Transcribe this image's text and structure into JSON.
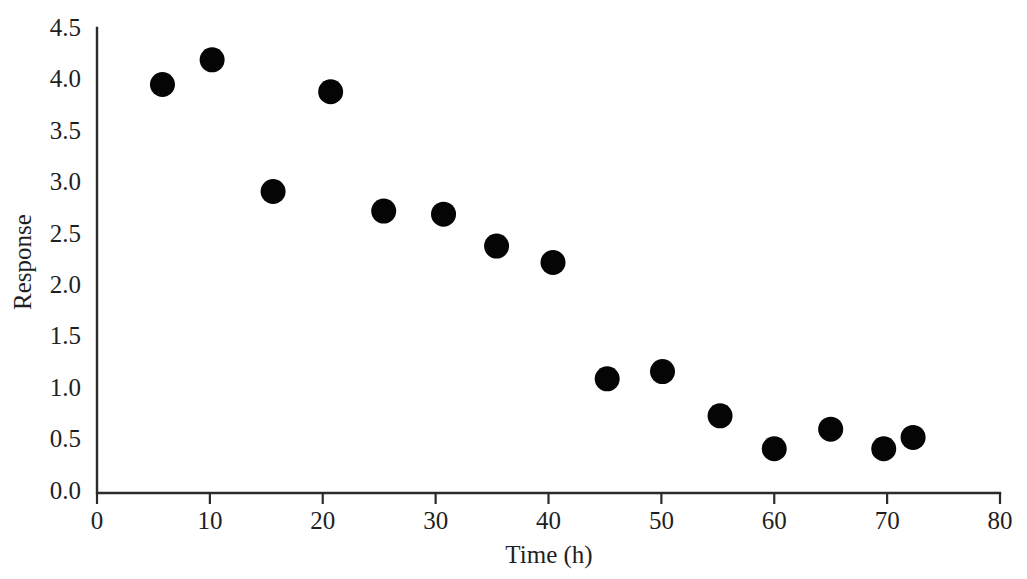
{
  "chart_data": {
    "type": "scatter",
    "title": "",
    "xlabel": "Time (h)",
    "ylabel": "Response",
    "xlim": [
      0,
      80
    ],
    "ylim": [
      0.0,
      4.5
    ],
    "grid": false,
    "legend": null,
    "x_ticks": [
      "0",
      "10",
      "20",
      "30",
      "40",
      "50",
      "60",
      "70",
      "80"
    ],
    "x_tick_values": [
      0,
      10,
      20,
      30,
      40,
      50,
      60,
      70,
      80
    ],
    "y_ticks": [
      "0.0",
      "0.5",
      "1.0",
      "1.5",
      "2.0",
      "2.5",
      "3.0",
      "3.5",
      "4.0",
      "4.5"
    ],
    "y_tick_values": [
      0.0,
      0.5,
      1.0,
      1.5,
      2.0,
      2.5,
      3.0,
      3.5,
      4.0,
      4.5
    ],
    "marker": {
      "shape": "circle",
      "color": "#050505",
      "size_px": 25
    },
    "series": [
      {
        "name": "Response",
        "points": [
          {
            "x": 5.8,
            "y": 3.97
          },
          {
            "x": 10.2,
            "y": 4.21
          },
          {
            "x": 15.6,
            "y": 2.93
          },
          {
            "x": 20.7,
            "y": 3.9
          },
          {
            "x": 25.4,
            "y": 2.74
          },
          {
            "x": 30.7,
            "y": 2.71
          },
          {
            "x": 35.4,
            "y": 2.4
          },
          {
            "x": 40.4,
            "y": 2.24
          },
          {
            "x": 45.2,
            "y": 1.11
          },
          {
            "x": 50.1,
            "y": 1.18
          },
          {
            "x": 55.2,
            "y": 0.75
          },
          {
            "x": 60.0,
            "y": 0.43
          },
          {
            "x": 65.0,
            "y": 0.62
          },
          {
            "x": 69.7,
            "y": 0.43
          },
          {
            "x": 72.3,
            "y": 0.54
          }
        ]
      }
    ]
  },
  "watermark": {
    "text": "",
    "visible": true
  }
}
